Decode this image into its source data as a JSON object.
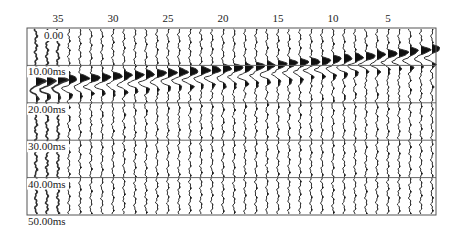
{
  "chart_data": {
    "type": "seismic-wiggle",
    "title": "",
    "xlabel": "Trace number",
    "ylabel": "Time (ms)",
    "x_tick_labels": [
      "35",
      "30",
      "25",
      "20",
      "15",
      "10",
      "5"
    ],
    "x_tick_traces": [
      35,
      30,
      25,
      20,
      15,
      10,
      5
    ],
    "y_tick_labels": [
      "0.00",
      "10.00ms",
      "20.00ms",
      "30.00ms",
      "40.00ms",
      "50.00ms"
    ],
    "y_tick_values_ms": [
      0,
      10,
      20,
      30,
      40,
      50
    ],
    "ylim_ms": [
      0,
      50
    ],
    "trace_count": 37,
    "trace_order": "descending left-to-right (37 at left, 1 at right)",
    "grid": "horizontal lines every 10 ms",
    "fill": "positive lobes filled black (variable area wiggle)",
    "first_break_ms_by_trace": {
      "1": 5.5,
      "2": 5.9,
      "3": 6.2,
      "4": 6.6,
      "5": 6.9,
      "6": 7.2,
      "7": 7.5,
      "8": 7.8,
      "9": 8.1,
      "10": 8.4,
      "11": 8.7,
      "12": 9.0,
      "13": 9.3,
      "14": 9.5,
      "15": 9.8,
      "16": 10.0,
      "17": 10.3,
      "18": 10.5,
      "19": 10.7,
      "20": 10.9,
      "21": 11.1,
      "22": 11.3,
      "23": 11.5,
      "24": 11.7,
      "25": 11.9,
      "26": 12.1,
      "27": 12.3,
      "28": 12.5,
      "29": 12.7,
      "30": 12.9,
      "31": 13.1,
      "32": 13.3,
      "33": 13.5,
      "34": 13.7,
      "35": 13.9,
      "36": 14.1,
      "37": 14.3
    }
  },
  "layout": {
    "plot_left": 27,
    "plot_right": 436,
    "plot_top": 28,
    "plot_bottom": 215,
    "trace1_x": 432,
    "trace_spacing": 11.0
  }
}
